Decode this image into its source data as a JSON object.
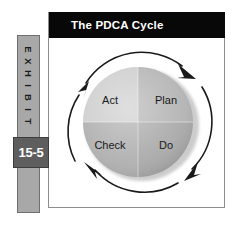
{
  "exhibit": {
    "label_letters": [
      "E",
      "X",
      "H",
      "I",
      "B",
      "I",
      "T"
    ],
    "label_text": "EXHIBIT",
    "number": "15-5",
    "bar_color": "#a8a8a8",
    "number_box_color": "#5e5e5e"
  },
  "title_bar": {
    "title": "The PDCA Cycle",
    "background": "#080808",
    "text_color": "#ffffff"
  },
  "diagram": {
    "name": "pdca-cycle",
    "direction": "clockwise",
    "quadrants": [
      {
        "id": "plan",
        "label": "Plan",
        "position": "top-right",
        "color": "#b4b4b4"
      },
      {
        "id": "do",
        "label": "Do",
        "position": "bottom-right",
        "color": "#aaaaaa"
      },
      {
        "id": "check",
        "label": "Check",
        "position": "bottom-left",
        "color": "#b0b0b0"
      },
      {
        "id": "act",
        "label": "Act",
        "position": "top-left",
        "color": "#cecece"
      }
    ],
    "arrow_color": "#1a1a1a",
    "arrow_count": 4
  },
  "panel": {
    "background": "#ffffff",
    "border_color": "#8d8d8d"
  }
}
